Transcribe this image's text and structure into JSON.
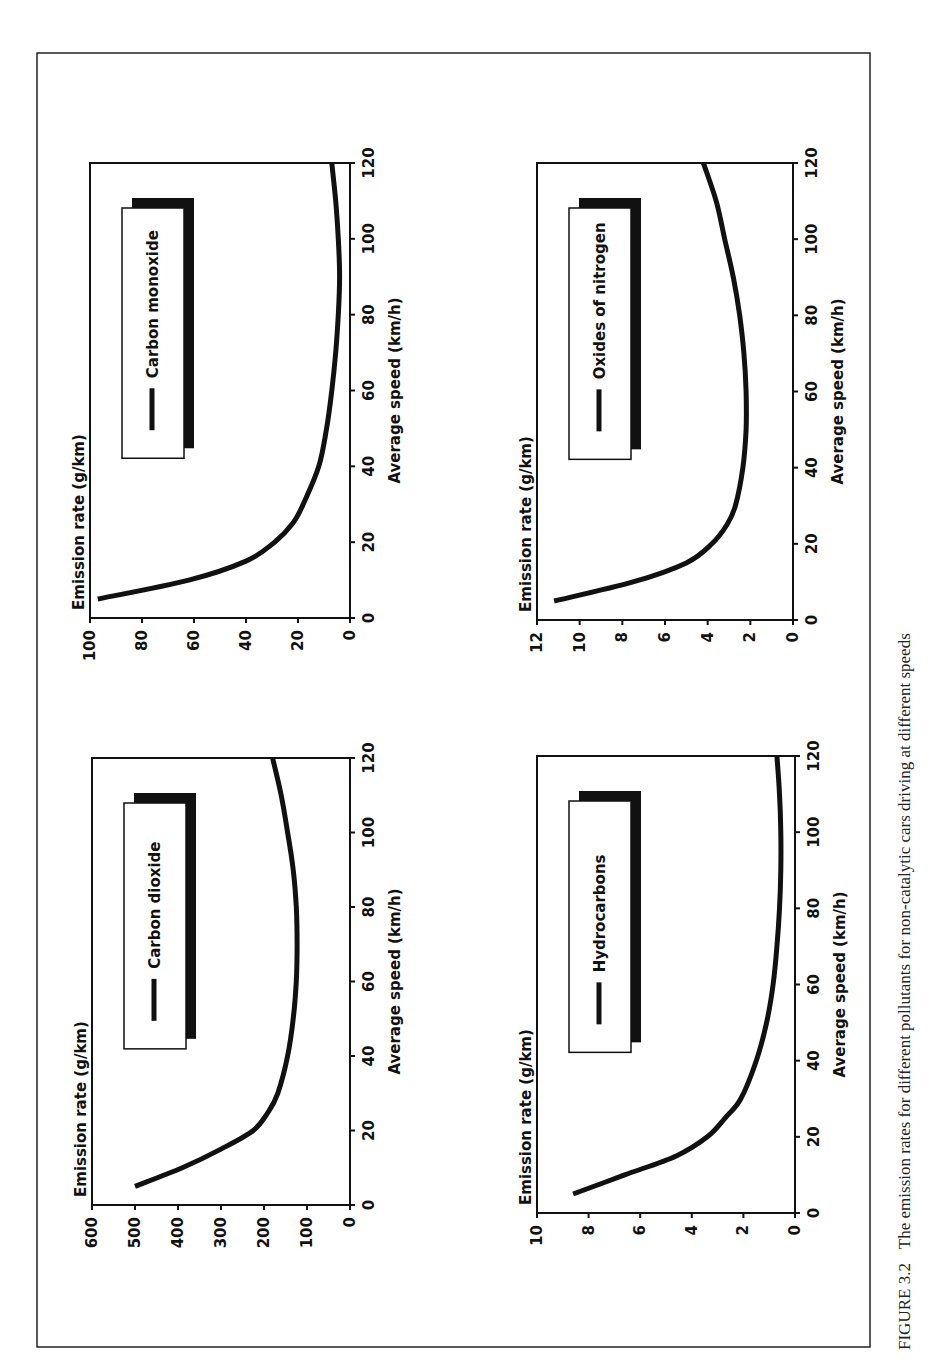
{
  "figure": {
    "caption_label": "FIGURE 3.2",
    "caption_text": "The emission rates for different pollutants for non-catalytic cars driving at different speeds"
  },
  "chart_data": [
    {
      "type": "line",
      "id": "co2",
      "title": "Carbon dioxide",
      "legend": [
        "Carbon dioxide"
      ],
      "xlabel": "Average speed (km/h)",
      "ylabel": "Emission rate (g/km)",
      "xlim": [
        0,
        120
      ],
      "ylim": [
        0,
        600
      ],
      "xticks": [
        0,
        20,
        40,
        60,
        80,
        100,
        120
      ],
      "yticks": [
        0,
        100,
        200,
        300,
        400,
        500,
        600
      ],
      "grid": false,
      "x": [
        5,
        10,
        15,
        20,
        25,
        30,
        40,
        50,
        60,
        70,
        80,
        90,
        100,
        110,
        120
      ],
      "values": [
        500,
        390,
        300,
        225,
        190,
        168,
        145,
        132,
        125,
        123,
        125,
        132,
        145,
        160,
        180
      ]
    },
    {
      "type": "line",
      "id": "co",
      "title": "Carbon monoxide",
      "legend": [
        "Carbon monoxide"
      ],
      "xlabel": "Average speed (km/h)",
      "ylabel": "Emission rate (g/km)",
      "xlim": [
        0,
        120
      ],
      "ylim": [
        0,
        100
      ],
      "xticks": [
        0,
        20,
        40,
        60,
        80,
        100,
        120
      ],
      "yticks": [
        0,
        20,
        40,
        60,
        80,
        100
      ],
      "grid": false,
      "x": [
        5,
        10,
        15,
        20,
        25,
        30,
        40,
        50,
        60,
        70,
        80,
        90,
        100,
        110,
        120
      ],
      "values": [
        97,
        62,
        40,
        29,
        22,
        18,
        12,
        9,
        7,
        5.5,
        4.5,
        4,
        4.5,
        5.5,
        7
      ]
    },
    {
      "type": "line",
      "id": "hc",
      "title": "Hydrocarbons",
      "legend": [
        "Hydrocarbons"
      ],
      "xlabel": "Average speed (km/h)",
      "ylabel": "Emission rate (g/km)",
      "xlim": [
        0,
        120
      ],
      "ylim": [
        0,
        10
      ],
      "xticks": [
        0,
        20,
        40,
        60,
        80,
        100,
        120
      ],
      "yticks": [
        0,
        2,
        4,
        6,
        8,
        10
      ],
      "grid": false,
      "x": [
        5,
        10,
        15,
        20,
        25,
        30,
        40,
        50,
        60,
        70,
        80,
        90,
        100,
        110,
        120
      ],
      "values": [
        8.6,
        6.6,
        4.6,
        3.4,
        2.7,
        2.1,
        1.5,
        1.1,
        0.85,
        0.7,
        0.6,
        0.55,
        0.55,
        0.6,
        0.7
      ]
    },
    {
      "type": "line",
      "id": "nox",
      "title": "Oxides of nitrogen",
      "legend": [
        "Oxides of nitrogen"
      ],
      "xlabel": "Average speed (km/h)",
      "ylabel": "Emission rate (g/km)",
      "xlim": [
        0,
        120
      ],
      "ylim": [
        0,
        12
      ],
      "xticks": [
        0,
        20,
        40,
        60,
        80,
        100,
        120
      ],
      "yticks": [
        0,
        2,
        4,
        6,
        8,
        10,
        12
      ],
      "grid": false,
      "x": [
        5,
        10,
        15,
        20,
        25,
        30,
        40,
        50,
        60,
        70,
        80,
        90,
        100,
        110,
        120
      ],
      "values": [
        11.2,
        7.5,
        5.0,
        3.8,
        3.1,
        2.7,
        2.35,
        2.2,
        2.2,
        2.3,
        2.5,
        2.8,
        3.2,
        3.6,
        4.2
      ]
    }
  ]
}
